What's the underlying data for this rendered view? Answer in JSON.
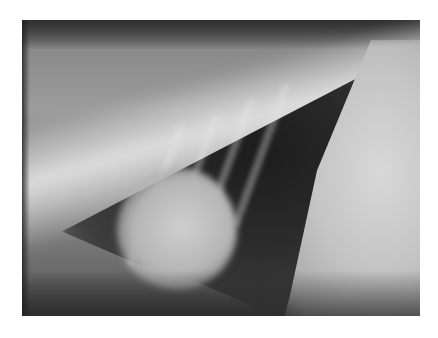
{
  "image": {
    "subject": "lateral thoracic radiograph",
    "description": "Grayscale X-ray showing vertebral spine along the top, dark lung field, heart silhouette lower-left, and bright diaphragm/abdomen on right",
    "colors": {
      "background": "#ffffff",
      "lung_dark": "#1c1c1c",
      "bone_bright": "#e6e6e6",
      "soft_tissue": "#9c9c9c"
    }
  }
}
